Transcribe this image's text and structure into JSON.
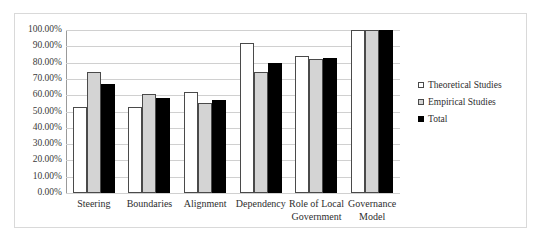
{
  "chart_data": {
    "type": "bar",
    "title": "",
    "xlabel": "",
    "ylabel": "",
    "ylim": [
      0,
      100
    ],
    "grid": true,
    "legend_position": "right",
    "categories": [
      "Steering",
      "Boundaries",
      "Alignment",
      "Dependency",
      "Role of Local Government",
      "Governance Model"
    ],
    "category_lines": [
      [
        "Steering"
      ],
      [
        "Boundaries"
      ],
      [
        "Alignment"
      ],
      [
        "Dependency"
      ],
      [
        "Role of Local",
        "Government"
      ],
      [
        "Governance",
        "Model"
      ]
    ],
    "ytick_labels": [
      "100.00%",
      "90.00%",
      "80.00%",
      "70.00%",
      "60.00%",
      "50.00%",
      "40.00%",
      "30.00%",
      "20.00%",
      "10.00%",
      "0.00%"
    ],
    "ytick_values": [
      100,
      90,
      80,
      70,
      60,
      50,
      40,
      30,
      20,
      10,
      0
    ],
    "series": [
      {
        "name": "Theoretical Studies",
        "color": "#ffffff",
        "values": [
          53,
          53,
          62,
          92,
          84,
          100
        ]
      },
      {
        "name": "Empirical Studies",
        "color": "#d4d4d4",
        "values": [
          74,
          61,
          55,
          74,
          82,
          100
        ]
      },
      {
        "name": "Total",
        "color": "#000000",
        "values": [
          67,
          58,
          57,
          80,
          83,
          100
        ]
      }
    ]
  },
  "legend": {
    "items": [
      {
        "label": "Theoretical Studies",
        "swatch": "theoretical"
      },
      {
        "label": "Empirical Studies",
        "swatch": "empirical"
      },
      {
        "label": "Total",
        "swatch": "total"
      }
    ]
  }
}
